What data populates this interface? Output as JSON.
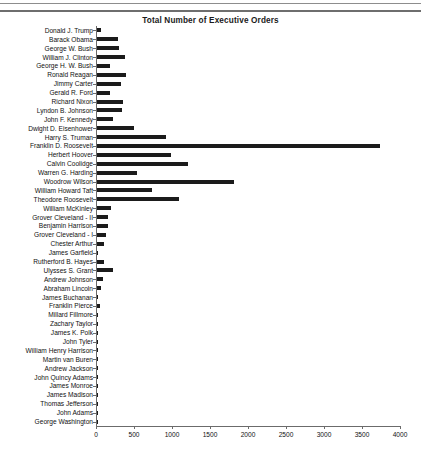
{
  "chart_data": {
    "type": "bar",
    "orientation": "horizontal",
    "title": "Total Number of Executive Orders",
    "xlabel": "",
    "ylabel": "",
    "xlim": [
      0,
      4000
    ],
    "xticks": [
      0,
      500,
      1000,
      1500,
      2000,
      2500,
      3000,
      3500,
      4000
    ],
    "grid": false,
    "legend": false,
    "bar_color": "#1b1b1b",
    "categories": [
      "Donald J. Trump",
      "Barack Obama",
      "George W. Bush",
      "William J. Clinton",
      "George H. W. Bush",
      "Ronald Reagan",
      "Jimmy Carter",
      "Gerald R. Ford",
      "Richard Nixon",
      "Lyndon B. Johnson",
      "John F. Kennedy",
      "Dwight D. Eisenhower",
      "Harry S. Truman",
      "Franklin D. Roosevelt",
      "Herbert Hoover",
      "Calvin Coolidge",
      "Warren G. Harding",
      "Woodrow Wilson",
      "William Howard Taft",
      "Theodore Roosevelt",
      "William McKinley",
      "Grover Cleveland - II",
      "Benjamin Harrison",
      "Grover Cleveland - I",
      "Chester Arthur",
      "James Garfield",
      "Rutherford B. Hayes",
      "Ulysses S. Grant",
      "Andrew Johnson",
      "Abraham Lincoln",
      "James Buchanan",
      "Franklin Pierce",
      "Millard Fillmore",
      "Zachary Taylor",
      "James K. Polk",
      "John Tyler",
      "William Henry Harrison",
      "Martin van Buren",
      "Andrew Jackson",
      "John Quincy Adams",
      "James Monroe",
      "James Madison",
      "Thomas Jefferson",
      "John Adams",
      "George Washington"
    ],
    "values": [
      55,
      277,
      291,
      364,
      166,
      381,
      320,
      169,
      346,
      325,
      214,
      484,
      907,
      3721,
      968,
      1203,
      522,
      1803,
      724,
      1081,
      185,
      140,
      143,
      113,
      96,
      6,
      92,
      217,
      79,
      48,
      16,
      35,
      12,
      5,
      18,
      17,
      0,
      10,
      12,
      3,
      1,
      1,
      4,
      1,
      8
    ]
  }
}
